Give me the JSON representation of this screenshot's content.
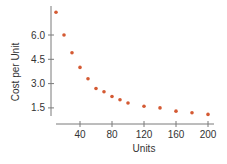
{
  "chart_data": {
    "type": "scatter",
    "title": "",
    "xlabel": "Units",
    "ylabel": "Cost per Unit",
    "xlim": [
      0,
      205
    ],
    "ylim": [
      1.0,
      7.5
    ],
    "xticks": [
      40,
      80,
      120,
      160,
      200
    ],
    "xtick_labels": [
      "40",
      "80",
      "120",
      "160",
      "200"
    ],
    "yticks": [
      1.5,
      3.0,
      4.5,
      6.0
    ],
    "ytick_labels": [
      "1.5",
      "3.0",
      "4.5",
      "6.0"
    ],
    "grid": false,
    "legend": null,
    "point_color": "#d45a33",
    "axis_color": "#7a7a7a",
    "x": [
      10,
      20,
      30,
      40,
      50,
      60,
      70,
      80,
      90,
      100,
      120,
      140,
      160,
      180,
      200
    ],
    "y": [
      7.4,
      6.0,
      4.9,
      4.0,
      3.3,
      2.7,
      2.5,
      2.2,
      2.0,
      1.8,
      1.6,
      1.5,
      1.3,
      1.2,
      1.1
    ]
  }
}
